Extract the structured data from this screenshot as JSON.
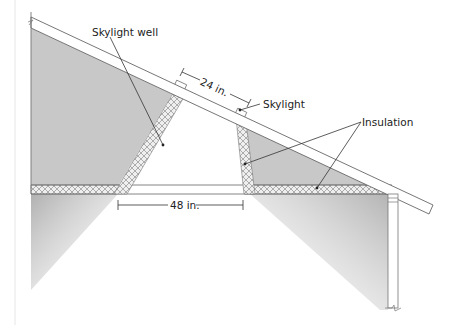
{
  "diagram": {
    "labels": {
      "skylight_well": "Skylight well",
      "skylight": "Skylight",
      "insulation": "Insulation",
      "width_top": "24 in.",
      "width_bottom": "48 in."
    },
    "colors": {
      "attic_fill": "#c8c8c8",
      "line": "#555555",
      "insulation_hatch": "#9a9a9a",
      "light_shadow": "#bdbdbd",
      "background": "#ffffff"
    },
    "components": [
      "roof rafter",
      "ceiling joist",
      "skylight",
      "skylight well (splayed)",
      "insulation (well walls and ceiling)",
      "exterior wall"
    ]
  }
}
